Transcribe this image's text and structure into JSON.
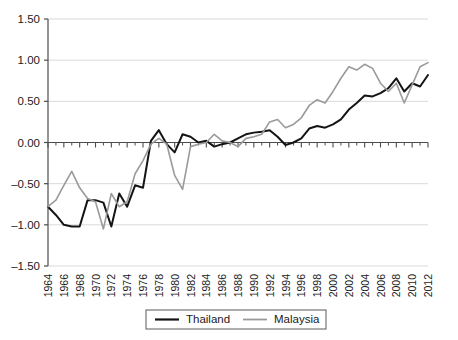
{
  "chart_data": {
    "type": "line",
    "title": "",
    "subtitle": "",
    "xlabel": "",
    "ylabel": "",
    "xlim": [
      1964,
      2012
    ],
    "ylim": [
      -1.5,
      1.5
    ],
    "grid": true,
    "grid_axis": "y",
    "legend_position": "bottom-center",
    "ytick_labels": [
      "1.50",
      "1.00",
      "0.50",
      "0.00",
      "-0.50",
      "-1.00",
      "-1.50"
    ],
    "ytick_values": [
      1.5,
      1.0,
      0.5,
      0.0,
      -0.5,
      -1.0,
      -1.5
    ],
    "xtick_labels": [
      "1964",
      "1966",
      "1968",
      "1970",
      "1972",
      "1974",
      "1976",
      "1978",
      "1980",
      "1982",
      "1984",
      "1986",
      "1988",
      "1990",
      "1992",
      "1994",
      "1996",
      "1998",
      "2000",
      "2002",
      "2004",
      "2006",
      "2008",
      "2010",
      "2012"
    ],
    "xtick_values": [
      1964,
      1966,
      1968,
      1970,
      1972,
      1974,
      1976,
      1978,
      1980,
      1982,
      1984,
      1986,
      1988,
      1990,
      1992,
      1994,
      1996,
      1998,
      2000,
      2002,
      2004,
      2006,
      2008,
      2010,
      2012
    ],
    "x": [
      1964,
      1965,
      1966,
      1967,
      1968,
      1969,
      1970,
      1971,
      1972,
      1973,
      1974,
      1975,
      1976,
      1977,
      1978,
      1979,
      1980,
      1981,
      1982,
      1983,
      1984,
      1985,
      1986,
      1987,
      1988,
      1989,
      1990,
      1991,
      1992,
      1993,
      1994,
      1995,
      1996,
      1997,
      1998,
      1999,
      2000,
      2001,
      2002,
      2003,
      2004,
      2005,
      2006,
      2007,
      2008,
      2009,
      2010,
      2011,
      2012
    ],
    "series": [
      {
        "name": "Thailand",
        "color": "#141414",
        "width": 2.0,
        "values": [
          -0.78,
          -0.88,
          -1.0,
          -1.02,
          -1.02,
          -0.7,
          -0.7,
          -0.73,
          -1.02,
          -0.62,
          -0.78,
          -0.52,
          -0.55,
          0.02,
          0.15,
          -0.02,
          -0.12,
          0.1,
          0.07,
          0.0,
          0.02,
          -0.05,
          -0.02,
          0.0,
          0.05,
          0.1,
          0.12,
          0.13,
          0.15,
          0.07,
          -0.03,
          0.0,
          0.05,
          0.17,
          0.2,
          0.18,
          0.22,
          0.28,
          0.4,
          0.48,
          0.57,
          0.56,
          0.6,
          0.66,
          0.78,
          0.62,
          0.72,
          0.68,
          0.82
        ]
      },
      {
        "name": "Malaysia",
        "color": "#9a9a9a",
        "width": 1.6,
        "values": [
          -0.78,
          -0.7,
          -0.52,
          -0.35,
          -0.55,
          -0.68,
          -0.72,
          -1.05,
          -0.62,
          -0.78,
          -0.72,
          -0.38,
          -0.22,
          -0.02,
          0.05,
          -0.02,
          -0.4,
          -0.57,
          -0.05,
          -0.02,
          0.0,
          0.1,
          0.02,
          0.0,
          -0.05,
          0.05,
          0.07,
          0.1,
          0.25,
          0.28,
          0.18,
          0.22,
          0.3,
          0.45,
          0.52,
          0.48,
          0.62,
          0.78,
          0.92,
          0.88,
          0.95,
          0.9,
          0.72,
          0.62,
          0.72,
          0.48,
          0.7,
          0.92,
          0.97
        ]
      }
    ]
  },
  "legend": {
    "items": [
      {
        "label": "Thailand",
        "color": "#141414"
      },
      {
        "label": "Malaysia",
        "color": "#9a9a9a"
      }
    ]
  },
  "colors": {
    "thailand": "#141414",
    "malaysia": "#9a9a9a",
    "axis": "#4d4d4d",
    "grid": "#d9d9d9",
    "text": "#1a1a1a",
    "background": "#ffffff"
  }
}
